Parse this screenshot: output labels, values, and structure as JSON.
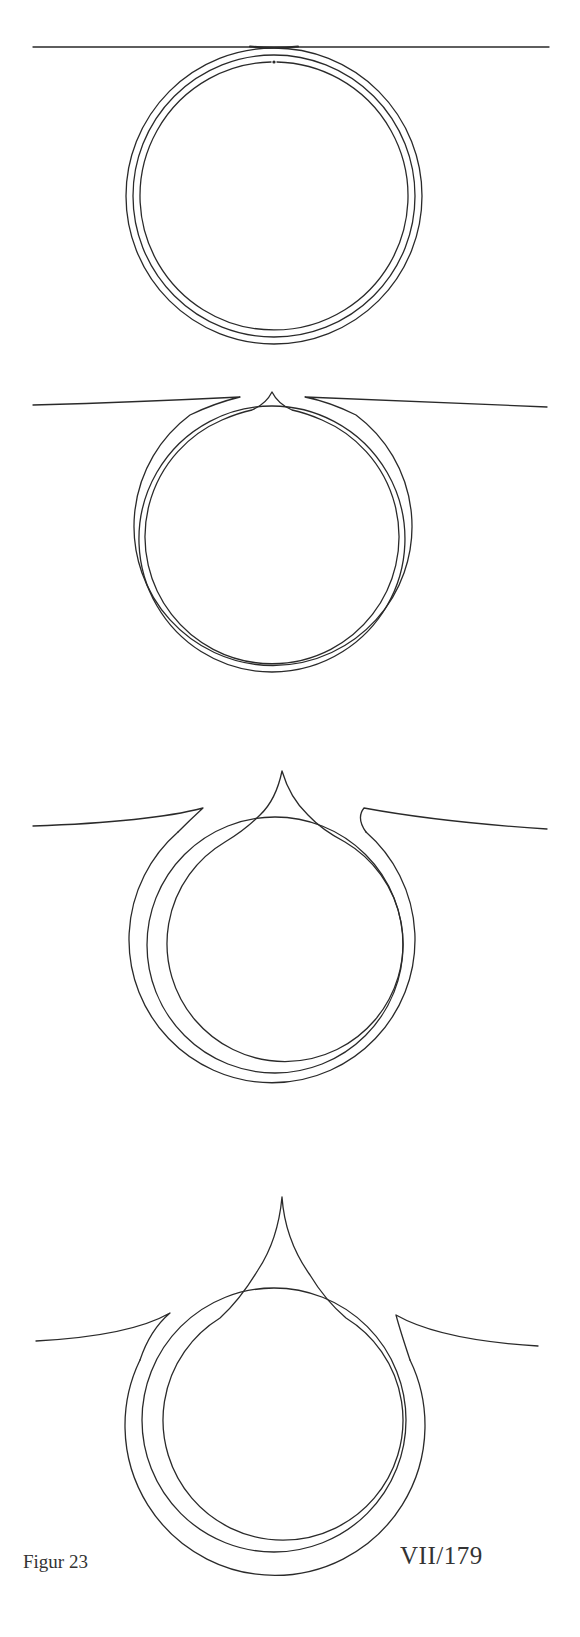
{
  "page": {
    "figure_label": "Figur 23",
    "page_reference": "VII/179",
    "ink_color": "#2a2a2a",
    "paper_color": "#ffffff"
  },
  "figures": [
    {
      "index": 1,
      "description": "Three concentric circles tangent to a straight horizontal line; small dot at top between inner rings",
      "center": [
        274,
        196
      ],
      "radii": [
        147,
        140,
        133
      ],
      "baseline_y": 47,
      "line_x_range": [
        33,
        549
      ]
    },
    {
      "index": 2,
      "description": "Horizontal line bends into outer ring with gaps at top; inner ring forms a small cusp above the middle ring",
      "center": [
        272,
        539
      ],
      "radii": [
        139,
        133,
        127
      ],
      "cusp_top": [
        272,
        392
      ],
      "line_left": [
        [
          33,
          405
        ],
        [
          245,
          399
        ]
      ],
      "line_right": [
        [
          298,
          399
        ],
        [
          547,
          407
        ]
      ]
    },
    {
      "index": 3,
      "description": "Outer ring detaches from line forming two hooks; inner ring forms a taller cusp crossing the middle ring",
      "center": [
        275,
        945
      ],
      "radii": [
        143,
        128,
        118
      ],
      "cusp_top": [
        282,
        771
      ],
      "line_left": [
        [
          33,
          826
        ],
        [
          203,
          808
        ]
      ],
      "line_right": [
        [
          367,
          807
        ],
        [
          547,
          829
        ]
      ]
    },
    {
      "index": 4,
      "description": "Further progression: hooks spread apart, inner ring forms a tall pointed cusp well above the middle ring",
      "center": [
        274,
        1420
      ],
      "radii": [
        150,
        132,
        120
      ],
      "cusp_top": [
        282,
        1197
      ],
      "line_left": [
        [
          36,
          1341
        ],
        [
          170,
          1313
        ]
      ],
      "line_right": [
        [
          396,
          1315
        ],
        [
          538,
          1346
        ]
      ]
    }
  ]
}
